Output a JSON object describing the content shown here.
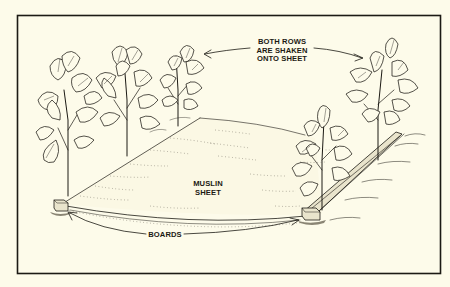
{
  "figure": {
    "background_color": "#fdfbea",
    "ink_color": "#1c1a14",
    "frame": {
      "x": 17,
      "y": 15,
      "width": 424,
      "height": 259
    }
  },
  "labels": {
    "rows_line1": "BOTH ROWS",
    "rows_line2": "ARE SHAKEN",
    "rows_line3": "ONTO SHEET",
    "sheet_line1": "MUSLIN",
    "sheet_line2": "SHEET",
    "boards": "BOARDS"
  },
  "elements": {
    "left_row_plants": 3,
    "right_row_plants": 2,
    "boards": 2
  }
}
